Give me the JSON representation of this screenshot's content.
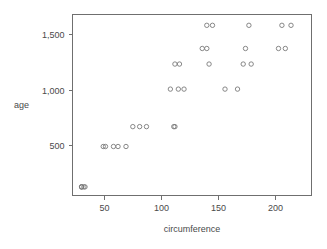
{
  "chart_data": {
    "type": "scatter",
    "title": "",
    "xlabel": "circumference",
    "ylabel": "age",
    "xlim": [
      22,
      232
    ],
    "ylim": [
      40,
      1680
    ],
    "grid": false,
    "legend": "none",
    "marker": "open-circle",
    "marker_color": "#7a7a7a",
    "xticks": [
      50,
      100,
      150,
      200
    ],
    "xtick_labels": [
      "50",
      "100",
      "150",
      "200"
    ],
    "yticks": [
      500,
      1000,
      1500
    ],
    "ytick_labels": [
      "500",
      "1,000",
      "1,500"
    ],
    "x": [
      30,
      33,
      30,
      32,
      30,
      58,
      69,
      51,
      62,
      49,
      87,
      111,
      75,
      112,
      81,
      115,
      156,
      108,
      167,
      125,
      120,
      172,
      112,
      179,
      142,
      142,
      179,
      136,
      209,
      174,
      145,
      177,
      140,
      214,
      177
    ],
    "y": [
      118,
      118,
      118,
      118,
      118,
      484,
      484,
      484,
      484,
      484,
      664,
      664,
      664,
      664,
      664,
      1004,
      1004,
      1004,
      1004,
      1004,
      1231,
      1231,
      1231,
      1231,
      1231,
      1372,
      1372,
      1372,
      1372,
      1372,
      1582,
      1582,
      1582,
      1582,
      1582
    ],
    "points": [
      {
        "circumference": 30,
        "age": 118
      },
      {
        "circumference": 33,
        "age": 118
      },
      {
        "circumference": 30,
        "age": 118
      },
      {
        "circumference": 32,
        "age": 118
      },
      {
        "circumference": 30,
        "age": 118
      },
      {
        "circumference": 49,
        "age": 484
      },
      {
        "circumference": 51,
        "age": 484
      },
      {
        "circumference": 58,
        "age": 484
      },
      {
        "circumference": 62,
        "age": 484
      },
      {
        "circumference": 69,
        "age": 484
      },
      {
        "circumference": 75,
        "age": 664
      },
      {
        "circumference": 81,
        "age": 664
      },
      {
        "circumference": 87,
        "age": 664
      },
      {
        "circumference": 111,
        "age": 664
      },
      {
        "circumference": 112,
        "age": 664
      },
      {
        "circumference": 108,
        "age": 1004
      },
      {
        "circumference": 115,
        "age": 1004
      },
      {
        "circumference": 120,
        "age": 1004
      },
      {
        "circumference": 156,
        "age": 1004
      },
      {
        "circumference": 167,
        "age": 1004
      },
      {
        "circumference": 112,
        "age": 1231
      },
      {
        "circumference": 116,
        "age": 1231
      },
      {
        "circumference": 142,
        "age": 1231
      },
      {
        "circumference": 172,
        "age": 1231
      },
      {
        "circumference": 179,
        "age": 1231
      },
      {
        "circumference": 136,
        "age": 1372
      },
      {
        "circumference": 140,
        "age": 1372
      },
      {
        "circumference": 174,
        "age": 1372
      },
      {
        "circumference": 203,
        "age": 1372
      },
      {
        "circumference": 209,
        "age": 1372
      },
      {
        "circumference": 140,
        "age": 1582
      },
      {
        "circumference": 145,
        "age": 1582
      },
      {
        "circumference": 177,
        "age": 1582
      },
      {
        "circumference": 206,
        "age": 1582
      },
      {
        "circumference": 214,
        "age": 1582
      }
    ]
  }
}
